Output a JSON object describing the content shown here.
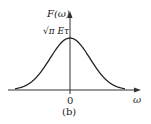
{
  "chart_data": {
    "type": "line",
    "title": "",
    "caption": "(b)",
    "xlabel": "ω",
    "ylabel": "F(ω)",
    "x_tick_labels": [
      "0"
    ],
    "y_annotations": [
      "√π Eτ"
    ],
    "series": [
      {
        "name": "F(ω)",
        "x": [
          -3,
          -2.5,
          -2,
          -1.5,
          -1,
          -0.5,
          0,
          0.5,
          1,
          1.5,
          2,
          2.5,
          3
        ],
        "values": [
          0.05,
          0.12,
          0.25,
          0.43,
          0.64,
          0.84,
          1.0,
          0.84,
          0.64,
          0.43,
          0.25,
          0.12,
          0.05
        ]
      }
    ],
    "peak_label": "√π Eτ",
    "grid": false
  },
  "labels": {
    "y_axis": "F(ω)",
    "peak": "√π Eτ",
    "origin": "0",
    "x_axis": "ω",
    "caption": "(b)"
  }
}
